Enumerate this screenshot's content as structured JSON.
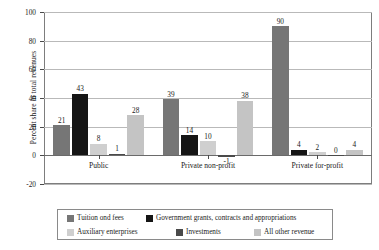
{
  "chart_data": {
    "type": "bar",
    "title": "",
    "xlabel": "",
    "ylabel": "Percent share in total revenues",
    "ylim": [
      -20,
      100
    ],
    "yticks": [
      -20,
      0,
      20,
      40,
      60,
      80,
      100
    ],
    "ytick_labels": [
      "-20",
      "0",
      "20",
      "40",
      "60",
      "80",
      "100"
    ],
    "grid": true,
    "legend_position": "bottom",
    "categories": [
      "Public",
      "Private non-profit",
      "Private for-profit"
    ],
    "series": [
      {
        "name": "Tuition ond fees",
        "color": "#767676",
        "values": [
          21,
          39,
          90
        ],
        "labels": [
          "21",
          "39",
          "90"
        ]
      },
      {
        "name": "Government grants, contracts and appropriations",
        "color": "#151515",
        "values": [
          43,
          14,
          4
        ],
        "labels": [
          "43",
          "14",
          "4"
        ]
      },
      {
        "name": "Auxiliary enterprises",
        "color": "#cfcfcf",
        "values": [
          8,
          10,
          2
        ],
        "labels": [
          "8",
          "10",
          "2"
        ]
      },
      {
        "name": "Investments",
        "color": "#4a4a4a",
        "values": [
          1,
          -1,
          0
        ],
        "labels": [
          "1",
          "-1",
          "0"
        ]
      },
      {
        "name": "All other revenue",
        "color": "#c4c4c4",
        "values": [
          28,
          38,
          4
        ],
        "labels": [
          "28",
          "38",
          "4"
        ]
      }
    ]
  },
  "axis": {
    "y_title": "Percent share in total revenues"
  }
}
